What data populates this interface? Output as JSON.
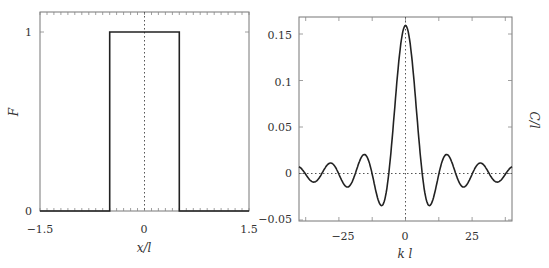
{
  "chart_data": [
    {
      "type": "line",
      "title": "",
      "xlabel": "x/l",
      "ylabel": "F",
      "xlim": [
        -1.5,
        1.5
      ],
      "ylim": [
        0,
        1.1
      ],
      "xticks": [
        "-1.5",
        "0",
        "1.5"
      ],
      "yticks": [
        "0",
        "1"
      ],
      "grid": false,
      "series": [
        {
          "name": "F",
          "x": [
            -1.5,
            -0.5,
            -0.5,
            0.5,
            0.5,
            1.5
          ],
          "y": [
            0,
            0,
            1,
            1,
            0,
            0
          ]
        }
      ],
      "reference_lines": [
        {
          "axis": "x",
          "value": 0,
          "style": "dotted"
        }
      ]
    },
    {
      "type": "line",
      "title": "",
      "xlabel": "k l",
      "ylabel": "C/l",
      "xlim": [
        -40,
        40
      ],
      "ylim": [
        -0.05,
        0.17
      ],
      "xticks": [
        "-25",
        "0",
        "25"
      ],
      "yticks": [
        "-0.05",
        "0",
        "0.05",
        "0.1",
        "0.15"
      ],
      "grid": false,
      "series": [
        {
          "name": "C/l",
          "formula": "sin(kl/2)/(pi*kl)",
          "x": [
            -40,
            -34,
            -28,
            -22,
            -15.5,
            -9,
            -6.28,
            0,
            6.28,
            9,
            15.5,
            22,
            28,
            34,
            40
          ],
          "y": [
            0.007,
            -0.009,
            0.011,
            -0.014,
            0.02,
            -0.035,
            0,
            0.159,
            0,
            -0.035,
            0.02,
            -0.014,
            0.011,
            -0.009,
            0.007
          ]
        }
      ],
      "reference_lines": [
        {
          "axis": "x",
          "value": 0,
          "style": "dotted"
        },
        {
          "axis": "y",
          "value": 0,
          "style": "dotted"
        }
      ]
    }
  ],
  "left_plot": {
    "xlabel": "x/l",
    "ylabel": "F",
    "xtick_labels": [
      "−1.5",
      "0",
      "1.5"
    ],
    "ytick_labels": [
      "0",
      "1"
    ]
  },
  "right_plot": {
    "xlabel": "k l",
    "ylabel": "C/l",
    "xtick_labels": [
      "−25",
      "0",
      "25"
    ],
    "ytick_labels": [
      "−0.05",
      "0",
      "0.05",
      "0.1",
      "0.15"
    ]
  }
}
